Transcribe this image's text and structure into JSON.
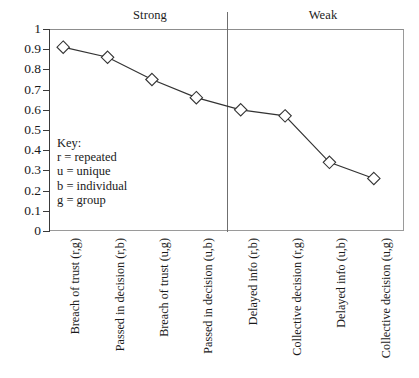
{
  "chart_data": {
    "type": "line",
    "title": "",
    "xlabel": "",
    "ylabel": "",
    "ylim": [
      0,
      1
    ],
    "yticks": [
      "0",
      "0.1",
      "0.2",
      "0.3",
      "0.4",
      "0.5",
      "0.6",
      "0.7",
      "0.8",
      "0.9",
      "1"
    ],
    "grid": false,
    "legend_position": "inside-lower-left",
    "marker": "open-diamond",
    "categories": [
      "Breach of trust (r,g)",
      "Passed in decision (r,b)",
      "Breach of trust (u,g)",
      "Passed in decision (u,b)",
      "Delayed info (r,b)",
      "Collective decision (r,g)",
      "Delayed info (u,b)",
      "Collective decision (u,g)"
    ],
    "values": [
      0.91,
      0.86,
      0.75,
      0.66,
      0.6,
      0.57,
      0.34,
      0.26
    ],
    "groups": [
      {
        "label": "Strong",
        "categories": [
          0,
          1,
          2,
          3
        ]
      },
      {
        "label": "Weak",
        "categories": [
          4,
          5,
          6,
          7
        ]
      }
    ],
    "annotations": {
      "divider": "vertical separator between Strong and Weak groups"
    },
    "colors": {
      "line": "#333333",
      "marker_fill": "#ffffff",
      "marker_stroke": "#333333",
      "axis": "#3a3a3a",
      "frame": "#9a9a9a"
    }
  },
  "key": {
    "title": "Key:",
    "entries": [
      {
        "symbol": "r",
        "equals": "=",
        "meaning": "repeated",
        "text": "r  = repeated"
      },
      {
        "symbol": "u",
        "equals": "=",
        "meaning": "unique",
        "text": "u  = unique"
      },
      {
        "symbol": "b",
        "equals": "=",
        "meaning": "individual",
        "text": "b  = individual"
      },
      {
        "symbol": "g",
        "equals": "=",
        "meaning": "group",
        "text": "g  = group"
      }
    ]
  }
}
